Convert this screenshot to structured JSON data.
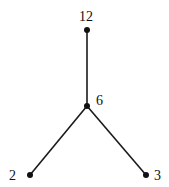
{
  "diagram": {
    "type": "tree",
    "nodes": [
      {
        "id": "n12",
        "label": "12",
        "x": 87,
        "y": 30,
        "lx": 86,
        "ly": 21,
        "anchor": "middle"
      },
      {
        "id": "n6",
        "label": "6",
        "x": 87,
        "y": 106,
        "lx": 96,
        "ly": 105,
        "anchor": "start"
      },
      {
        "id": "n2",
        "label": "2",
        "x": 30,
        "y": 175,
        "lx": 16,
        "ly": 180,
        "anchor": "end"
      },
      {
        "id": "n3",
        "label": "3",
        "x": 146,
        "y": 175,
        "lx": 154,
        "ly": 180,
        "anchor": "start"
      }
    ],
    "edges": [
      {
        "from": "n12",
        "to": "n6"
      },
      {
        "from": "n6",
        "to": "n2"
      },
      {
        "from": "n6",
        "to": "n3"
      }
    ],
    "colors": {
      "line": "#1a1a1a",
      "node": "#111111"
    }
  }
}
